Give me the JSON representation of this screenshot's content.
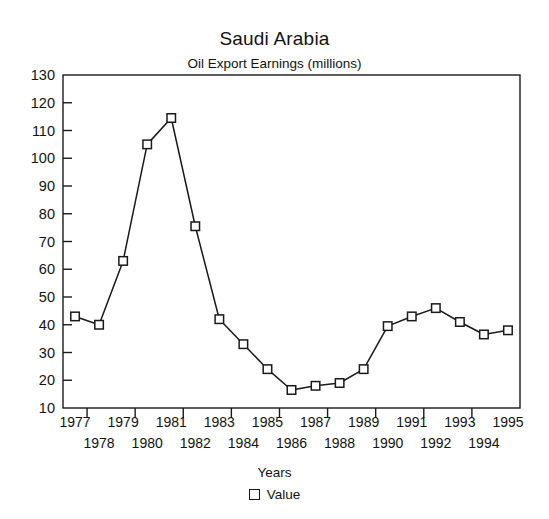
{
  "chart_data": {
    "type": "line",
    "title": "Saudi Arabia",
    "subtitle": "Oil Export Earnings (millions)",
    "xlabel": "Years",
    "ylabel": "",
    "xlim": [
      1976.5,
      1995.5
    ],
    "ylim": [
      10,
      130
    ],
    "ytick_step": 10,
    "grid": false,
    "legend_position": "bottom",
    "marker": "open-square",
    "line_color": "#1a1a1a",
    "series": [
      {
        "name": "Value",
        "categories": [
          "1977",
          "1978",
          "1979",
          "1980",
          "1981",
          "1982",
          "1983",
          "1984",
          "1985",
          "1986",
          "1987",
          "1988",
          "1989",
          "1990",
          "1991",
          "1992",
          "1993",
          "1994",
          "1995"
        ],
        "values": [
          43,
          40,
          63,
          105,
          114.5,
          75.5,
          42,
          33,
          24,
          16.5,
          18,
          19,
          24,
          39.5,
          43,
          46,
          41,
          36.5,
          38
        ]
      }
    ],
    "ytick_labels": [
      "130",
      "120",
      "110",
      "100",
      "90",
      "80",
      "70",
      "60",
      "50",
      "40",
      "30",
      "20",
      "10"
    ],
    "xtick_labels_top_row": [
      "1977",
      "1979",
      "1981",
      "1983",
      "1985",
      "1987",
      "1989",
      "1991",
      "1993",
      "1995"
    ],
    "xtick_labels_bottom_row": [
      "1978",
      "1980",
      "1982",
      "1984",
      "1986",
      "1988",
      "1990",
      "1992",
      "1994"
    ]
  },
  "legend": {
    "entry_label": "Value"
  }
}
